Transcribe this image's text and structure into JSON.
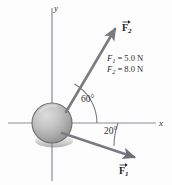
{
  "figure": {
    "kind": "free-body-force-diagram",
    "background_color": "#fdfdfd",
    "axes": {
      "x_label": "x",
      "y_label": "y",
      "axis_color": "#8c8c99",
      "origin_px": [
        52,
        123
      ]
    },
    "object": {
      "name": "sphere",
      "center_px": [
        52,
        123
      ],
      "radius_px": 20,
      "fill_light": "#d8d8d8",
      "fill_dark": "#8a8a8a",
      "edge_color": "#6b6b6b"
    },
    "vectors": [
      {
        "id": "F2",
        "label": "F",
        "subscript": "2",
        "angle_deg": 60,
        "color": "#7a7a82",
        "tail_px": [
          66,
          112
        ],
        "tip_px": [
          117,
          27
        ]
      },
      {
        "id": "F1",
        "label": "F",
        "subscript": "1",
        "angle_deg": 20,
        "color": "#7a7a82",
        "tail_px": [
          62,
          132
        ],
        "tip_px": [
          137,
          159
        ]
      }
    ],
    "angles": [
      {
        "id": "angle-60",
        "text": "60°",
        "value_deg": 60,
        "label_px": [
          84,
          98
        ]
      },
      {
        "id": "angle-20",
        "text": "20°",
        "value_deg": 20,
        "label_px": [
          106,
          131
        ]
      }
    ],
    "magnitudes": [
      {
        "symbol": "F",
        "subscript": "1",
        "equals": "=",
        "value": "5.0 N"
      },
      {
        "symbol": "F",
        "subscript": "2",
        "equals": "=",
        "value": "8.0 N"
      }
    ]
  }
}
